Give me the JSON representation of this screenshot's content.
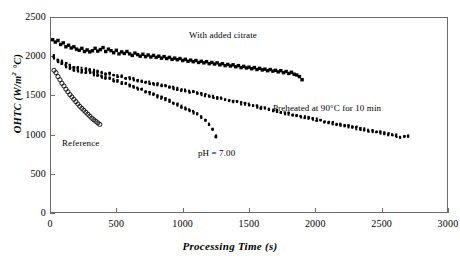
{
  "chart_data": {
    "type": "scatter",
    "title": "",
    "xlabel": "Processing Time (s)",
    "ylabel": "OHTC (W/m² °C)",
    "xlim": [
      0,
      3000
    ],
    "ylim": [
      0,
      2500
    ],
    "xticks": [
      0,
      500,
      1000,
      1500,
      2000,
      2500,
      3000
    ],
    "yticks": [
      0,
      500,
      1000,
      1500,
      2000,
      2500
    ],
    "grid": false,
    "legend_position": "in-plot-annotations",
    "marker_color": "#000000",
    "frame_color": "#6b6b6b",
    "series": [
      {
        "name": "With added citrate",
        "marker": "filled-square",
        "label_x": 1070,
        "label_y": 2265,
        "x": [
          20,
          40,
          60,
          80,
          100,
          120,
          140,
          160,
          180,
          200,
          220,
          240,
          260,
          280,
          300,
          320,
          340,
          360,
          380,
          400,
          420,
          440,
          460,
          480,
          500,
          520,
          540,
          560,
          580,
          600,
          620,
          640,
          660,
          680,
          700,
          720,
          740,
          760,
          780,
          800,
          820,
          840,
          860,
          880,
          900,
          920,
          940,
          960,
          980,
          1000,
          1020,
          1040,
          1060,
          1080,
          1100,
          1120,
          1140,
          1160,
          1180,
          1200,
          1220,
          1240,
          1260,
          1280,
          1300,
          1320,
          1340,
          1360,
          1380,
          1400,
          1420,
          1440,
          1460,
          1480,
          1500,
          1520,
          1540,
          1560,
          1580,
          1600,
          1620,
          1640,
          1660,
          1680,
          1700,
          1720,
          1740,
          1760,
          1780,
          1800,
          1820,
          1840,
          1860,
          1880,
          1900
        ],
        "y": [
          2210,
          2180,
          2200,
          2150,
          2170,
          2120,
          2140,
          2105,
          2120,
          2090,
          2075,
          2100,
          2060,
          2080,
          2055,
          2070,
          2100,
          2065,
          2085,
          2110,
          2060,
          2090,
          2070,
          2045,
          2075,
          2030,
          2055,
          2035,
          2060,
          2030,
          2010,
          2040,
          2020,
          2000,
          2025,
          1995,
          2015,
          1990,
          2010,
          1985,
          2000,
          1975,
          1995,
          1970,
          1985,
          1960,
          1975,
          1955,
          1970,
          1945,
          1960,
          1935,
          1950,
          1930,
          1945,
          1920,
          1935,
          1915,
          1930,
          1905,
          1920,
          1900,
          1915,
          1890,
          1905,
          1880,
          1895,
          1875,
          1890,
          1865,
          1880,
          1855,
          1870,
          1850,
          1860,
          1840,
          1855,
          1830,
          1845,
          1825,
          1835,
          1815,
          1830,
          1810,
          1820,
          1800,
          1815,
          1790,
          1805,
          1780,
          1795,
          1770,
          1760,
          1740,
          1700
        ]
      },
      {
        "name": "Preheated at 90°C for 10 min",
        "marker": "small-dense",
        "label_x": 1680,
        "label_y": 1330,
        "x": [
          30,
          60,
          90,
          120,
          150,
          180,
          210,
          240,
          270,
          300,
          330,
          360,
          390,
          420,
          450,
          480,
          510,
          540,
          570,
          600,
          630,
          660,
          690,
          720,
          750,
          780,
          810,
          840,
          870,
          900,
          930,
          960,
          990,
          1020,
          1050,
          1080,
          1110,
          1140,
          1170,
          1200,
          1230,
          1260,
          1290,
          1320,
          1350,
          1380,
          1410,
          1440,
          1470,
          1500,
          1530,
          1560,
          1590,
          1620,
          1650,
          1680,
          1710,
          1740,
          1770,
          1800,
          1830,
          1860,
          1890,
          1920,
          1950,
          1980,
          2010,
          2040,
          2070,
          2100,
          2130,
          2160,
          2190,
          2220,
          2250,
          2280,
          2310,
          2340,
          2370,
          2400,
          2430,
          2460,
          2490,
          2520,
          2550,
          2580,
          2610,
          2640,
          2670,
          2700
        ],
        "y": [
          2000,
          1960,
          1930,
          1900,
          1880,
          1860,
          1845,
          1835,
          1840,
          1825,
          1810,
          1800,
          1790,
          1780,
          1775,
          1760,
          1750,
          1740,
          1730,
          1720,
          1705,
          1695,
          1685,
          1675,
          1660,
          1650,
          1640,
          1630,
          1620,
          1605,
          1595,
          1585,
          1570,
          1560,
          1550,
          1540,
          1525,
          1515,
          1505,
          1490,
          1480,
          1470,
          1460,
          1445,
          1435,
          1425,
          1415,
          1400,
          1390,
          1380,
          1365,
          1355,
          1345,
          1335,
          1320,
          1310,
          1300,
          1290,
          1275,
          1265,
          1255,
          1245,
          1230,
          1220,
          1210,
          1200,
          1190,
          1175,
          1165,
          1155,
          1145,
          1135,
          1125,
          1115,
          1105,
          1095,
          1085,
          1075,
          1065,
          1055,
          1045,
          1035,
          1025,
          1015,
          1005,
          995,
          985,
          975,
          980,
          985
        ]
      },
      {
        "name": "pH = 7.00",
        "marker": "small-dense",
        "label_x": 930,
        "label_y": 1050,
        "x": [
          30,
          60,
          90,
          120,
          150,
          180,
          210,
          240,
          270,
          300,
          330,
          360,
          390,
          420,
          450,
          480,
          510,
          540,
          570,
          600,
          630,
          660,
          690,
          720,
          750,
          780,
          810,
          840,
          870,
          900,
          930,
          960,
          990,
          1020,
          1050,
          1080,
          1110,
          1140,
          1170,
          1200,
          1225,
          1250
        ],
        "y": [
          1980,
          1940,
          1905,
          1875,
          1850,
          1830,
          1815,
          1805,
          1800,
          1785,
          1770,
          1755,
          1740,
          1725,
          1710,
          1695,
          1680,
          1660,
          1645,
          1625,
          1605,
          1590,
          1570,
          1550,
          1530,
          1510,
          1490,
          1470,
          1450,
          1430,
          1405,
          1385,
          1360,
          1335,
          1310,
          1285,
          1255,
          1225,
          1190,
          1130,
          1060,
          980
        ]
      },
      {
        "name": "Reference",
        "marker": "open-circle",
        "label_x": 175,
        "label_y": 1085,
        "x": [
          30,
          45,
          60,
          75,
          90,
          105,
          120,
          135,
          150,
          165,
          180,
          195,
          210,
          225,
          240,
          255,
          270,
          285,
          300,
          315,
          330,
          345,
          360,
          375
        ],
        "y": [
          1820,
          1790,
          1740,
          1700,
          1655,
          1620,
          1580,
          1545,
          1510,
          1480,
          1450,
          1420,
          1390,
          1360,
          1335,
          1310,
          1285,
          1260,
          1235,
          1210,
          1190,
          1170,
          1150,
          1130
        ]
      }
    ]
  },
  "axes": {
    "x_tick_labels": [
      "0",
      "500",
      "1000",
      "1500",
      "2000",
      "2500",
      "3000"
    ],
    "y_tick_labels": [
      "0",
      "500",
      "1000",
      "1500",
      "2000",
      "2500"
    ],
    "x_title": "Processing Time (s)",
    "y_title_main": "OHTC (W/m",
    "y_title_sup": "2",
    "y_title_tail": " °C)"
  },
  "annotations": {
    "citrate": "With added citrate",
    "preheated": "Preheated at 90°C for 10 min",
    "ph": "pH = 7.00",
    "reference": "Reference"
  }
}
